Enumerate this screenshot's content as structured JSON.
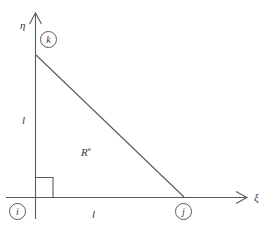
{
  "figure": {
    "background_color": "#ffffff",
    "line_color": "#5a5a5a",
    "text_color": "#3a3a3a",
    "axes": {
      "horizontal": {
        "name": "xi-axis",
        "label": "ξ",
        "direction": "right"
      },
      "vertical": {
        "name": "eta-axis",
        "label": "η",
        "direction": "up"
      }
    },
    "nodes": [
      {
        "id": "i",
        "label": "i",
        "position": "origin"
      },
      {
        "id": "j",
        "label": "j",
        "position": "xi-axis"
      },
      {
        "id": "k",
        "label": "k",
        "position": "eta-axis"
      }
    ],
    "dimensions": [
      {
        "name": "vertical-leg",
        "label": "l"
      },
      {
        "name": "horizontal-leg",
        "label": "l"
      }
    ],
    "region": {
      "label": "R",
      "superscript": "e"
    },
    "right_angle": {
      "name": "right-angle-marker",
      "at_node": "i",
      "degrees": 90
    }
  }
}
